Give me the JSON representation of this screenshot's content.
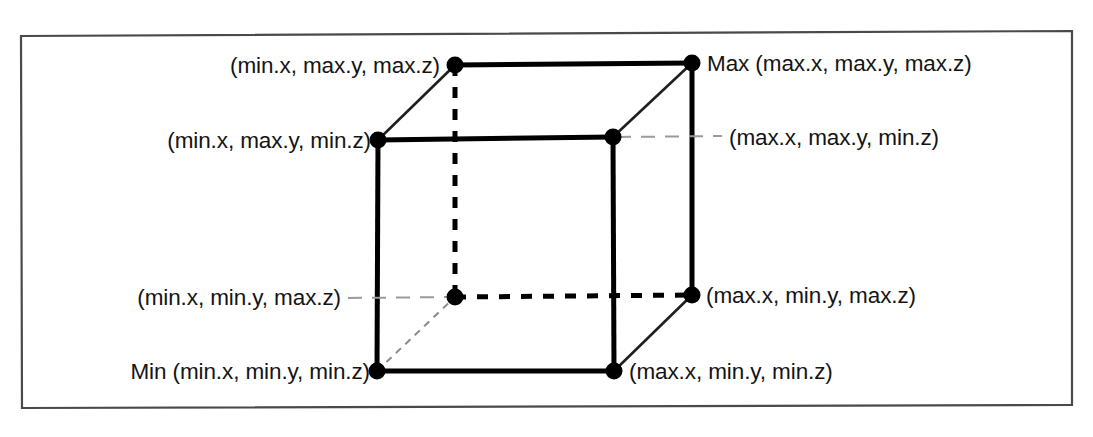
{
  "figure": {
    "type": "axis-aligned-bounding-box-diagram",
    "frame": {
      "border_color": "#4a4a4a"
    },
    "colors": {
      "edge_solid": "#000000",
      "edge_hidden_dashed": "#000000",
      "edge_thin_diagonal": "#2b2b2b",
      "leader_line": "#9a9a9a",
      "vertex_dot": "#000000",
      "label_text": "#141414",
      "background": "#ffffff"
    },
    "vertices": [
      {
        "id": "back-top-left",
        "label": "(min.x, max.y, max.z)",
        "label_side": "left",
        "x": 455,
        "y": 65
      },
      {
        "id": "back-top-right",
        "label": "Max (max.x, max.y, max.z)",
        "label_side": "right",
        "x": 692,
        "y": 63
      },
      {
        "id": "front-top-left",
        "label": "(min.x, max.y, min.z)",
        "label_side": "left",
        "x": 378,
        "y": 140
      },
      {
        "id": "front-top-right",
        "label": "(max.x, max.y, min.z)",
        "label_side": "right",
        "x": 613,
        "y": 137
      },
      {
        "id": "back-bottom-left",
        "label": "(min.x, min.y, max.z)",
        "label_side": "left",
        "x": 455,
        "y": 297
      },
      {
        "id": "back-bottom-right",
        "label": "(max.x, min.y, max.z)",
        "label_side": "right",
        "x": 692,
        "y": 295
      },
      {
        "id": "front-bottom-left",
        "label": "Min (min.x, min.y, min.z)",
        "label_side": "left",
        "x": 377,
        "y": 371
      },
      {
        "id": "front-bottom-right",
        "label": "(max.x, min.y, min.z)",
        "label_side": "right",
        "x": 614,
        "y": 371
      }
    ],
    "labels": {
      "back_top_left": "(min.x, max.y, max.z)",
      "back_top_right": "Max (max.x, max.y, max.z)",
      "front_top_left": "(min.x, max.y, min.z)",
      "front_top_right": "(max.x, max.y, min.z)",
      "back_bottom_left": "(min.x, min.y, max.z)",
      "back_bottom_right": "(max.x, min.y, max.z)",
      "front_bottom_left": "Min (min.x, min.y, min.z)",
      "front_bottom_right": "(max.x, min.y, min.z)"
    }
  }
}
